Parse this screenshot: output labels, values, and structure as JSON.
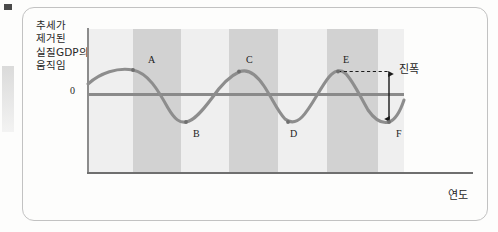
{
  "figure": {
    "y_axis_description": "추세가\n제거된\n실질GDP의\n움직임",
    "zero_label": "0",
    "x_axis_label": "연도",
    "amplitude_label": "진폭"
  },
  "colors": {
    "band_light": "#efefef",
    "band_dark": "#d2d2d2",
    "curve": "#8a8a8a",
    "zero_line": "#8a8a8a",
    "axis": "#7a7a7a",
    "frame": "#c2c2c2",
    "text": "#272727",
    "arrow": "#1a1a1a",
    "background": "#fdfdfc"
  },
  "point_labels": [
    {
      "name": "A",
      "x": 148,
      "y": 54
    },
    {
      "name": "B",
      "x": 193,
      "y": 128
    },
    {
      "name": "C",
      "x": 246,
      "y": 54
    },
    {
      "name": "D",
      "x": 290,
      "y": 128
    },
    {
      "name": "E",
      "x": 343,
      "y": 54
    },
    {
      "name": "F",
      "x": 396,
      "y": 128
    }
  ],
  "chart_data": {
    "type": "line",
    "title": "",
    "xlabel": "연도",
    "ylabel": "추세가 제거된 실질GDP의 움직임",
    "grid": false,
    "legend": "none",
    "annotations": [
      {
        "text": "진폭",
        "kind": "amplitude-bracket",
        "from_point": "E",
        "to_point": "F"
      },
      {
        "text": "0",
        "kind": "zero-axis-tick"
      }
    ],
    "bands": [
      {
        "index": 0,
        "shade": "light",
        "x_start": 0,
        "x_end": 45
      },
      {
        "index": 1,
        "shade": "dark",
        "x_start": 45,
        "x_end": 93
      },
      {
        "index": 2,
        "shade": "light",
        "x_start": 93,
        "x_end": 141
      },
      {
        "index": 3,
        "shade": "dark",
        "x_start": 141,
        "x_end": 190
      },
      {
        "index": 4,
        "shade": "light",
        "x_start": 190,
        "x_end": 239
      },
      {
        "index": 5,
        "shade": "dark",
        "x_start": 239,
        "x_end": 290
      },
      {
        "index": 6,
        "shade": "light",
        "x_start": 290,
        "x_end": 316
      }
    ],
    "series": [
      {
        "name": "추세 제거된 실질GDP",
        "description": "Sinusoidal business cycle around zero, peaks at A, C, E and troughs at B, D, F",
        "peaks": [
          "A",
          "C",
          "E"
        ],
        "troughs": [
          "B",
          "D",
          "F"
        ],
        "amplitude": 1.0,
        "x": [
          88,
          96,
          105,
          114,
          124,
          133,
          142,
          151,
          160,
          169,
          178,
          182,
          190,
          199,
          208,
          217,
          226,
          231,
          240,
          248,
          257,
          266,
          275,
          280,
          288,
          297,
          306,
          315,
          324,
          337,
          346,
          355,
          364,
          373,
          382,
          389,
          398,
          404
        ],
        "y": [
          84,
          79,
          75,
          72,
          70,
          70,
          72,
          77,
          85,
          95,
          107,
          118,
          122,
          121,
          115,
          106,
          96,
          88,
          80,
          74,
          71,
          70,
          72,
          76,
          84,
          95,
          107,
          117,
          122,
          71,
          77,
          86,
          97,
          109,
          118,
          122,
          114,
          100
        ]
      }
    ],
    "axis_ranges": {
      "x": "time (years, unlabeled)",
      "y": "deviation from trend, 0 at center"
    }
  }
}
